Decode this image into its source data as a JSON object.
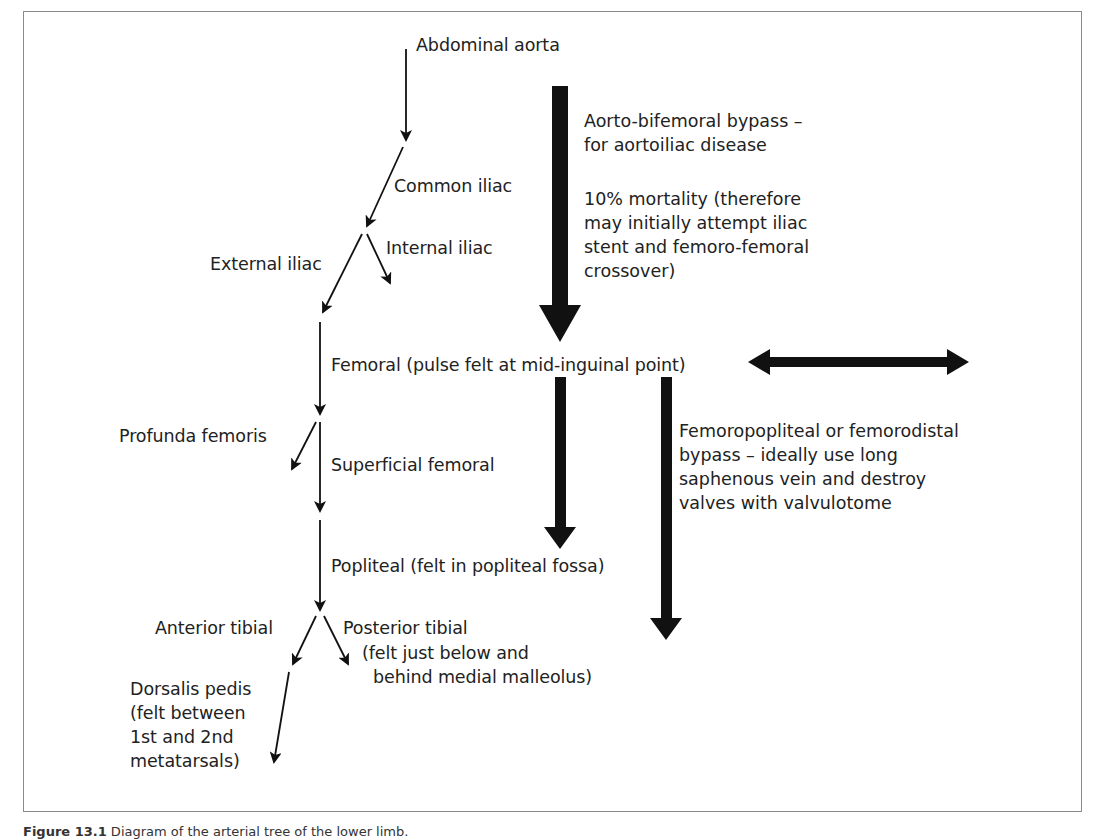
{
  "diagram": {
    "arteries": {
      "abdominal_aorta": "Abdominal aorta",
      "common_iliac": "Common iliac",
      "internal_iliac": "Internal iliac",
      "external_iliac": "External iliac",
      "femoral": "Femoral (pulse felt at mid-inguinal point)",
      "profunda_femoris": "Profunda femoris",
      "superficial_femoral": "Superficial femoral",
      "popliteal": "Popliteal (felt in popliteal fossa)",
      "anterior_tibial": "Anterior tibial",
      "posterior_tibial": "Posterior tibial",
      "posterior_tibial_note_1": "(felt just below and",
      "posterior_tibial_note_2": "behind medial malleolus)",
      "dorsalis_pedis": "Dorsalis pedis",
      "dorsalis_pedis_note_1": "(felt between",
      "dorsalis_pedis_note_2": "1st and 2nd",
      "dorsalis_pedis_note_3": "metatarsals)"
    },
    "bypass_notes": {
      "aorto_line_1": "Aorto-bifemoral bypass –",
      "aorto_line_2": "for aortoiliac disease",
      "mortality_line_1": "10% mortality (therefore",
      "mortality_line_2": "may initially attempt iliac",
      "mortality_line_3": "stent and femoro-femoral",
      "mortality_line_4": "crossover)",
      "fempop_line_1": "Femoropopliteal or femorodistal",
      "fempop_line_2": "bypass – ideally use long",
      "fempop_line_3": "saphenous vein and destroy",
      "fempop_line_4": "valves with valvulotome"
    },
    "caption": {
      "label": "Figure 13.1",
      "text": " Diagram of the arterial tree of the lower limb."
    },
    "colors": {
      "arrow": "#111111",
      "text": "#222222",
      "border": "#8a8a8a"
    }
  }
}
